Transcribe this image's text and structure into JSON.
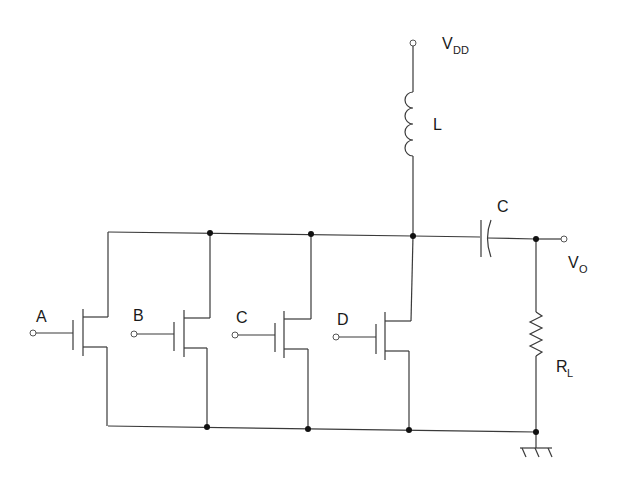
{
  "diagram": {
    "type": "circuit-schematic",
    "supply": {
      "label": "V",
      "subscript": "DD"
    },
    "inductor": {
      "label": "L"
    },
    "capacitor": {
      "label": "C"
    },
    "output": {
      "label": "V",
      "subscript": "O"
    },
    "load_resistor": {
      "label": "R",
      "subscript": "L"
    },
    "transistors": [
      {
        "id": "A",
        "label": "A"
      },
      {
        "id": "B",
        "label": "B"
      },
      {
        "id": "C",
        "label": "C"
      },
      {
        "id": "D",
        "label": "D"
      }
    ],
    "ground": {
      "label": ""
    },
    "colors": {
      "wire": "#3a3a3a",
      "node": "#111111",
      "background": "#ffffff"
    }
  }
}
